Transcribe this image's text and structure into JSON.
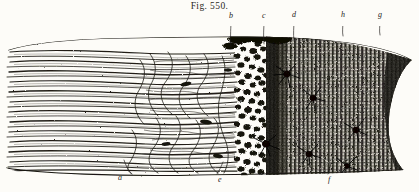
{
  "figure": {
    "caption": "Fig. 550.",
    "type": "engraving",
    "background_color": "#fdfcf8",
    "ink_color": "#1d1b18"
  },
  "labels": [
    {
      "id": "label-b",
      "text": "b",
      "x": 229,
      "y": 12,
      "leader_x": 231,
      "leader_y1": 21,
      "leader_y2": 47
    },
    {
      "id": "label-c",
      "text": "c",
      "x": 262,
      "y": 12,
      "leader_x": 264,
      "leader_y1": 21,
      "leader_y2": 44
    },
    {
      "id": "label-d",
      "text": "d",
      "x": 292,
      "y": 11,
      "leader_x": 294,
      "leader_y1": 21,
      "leader_y2": 40
    },
    {
      "id": "label-h",
      "text": "h",
      "x": 341,
      "y": 11,
      "leader_x": 343,
      "leader_y1": 21,
      "leader_y2": 36
    },
    {
      "id": "label-g-top",
      "text": "g",
      "x": 378,
      "y": 11,
      "leader_x": 380,
      "leader_y1": 21,
      "leader_y2": 35
    },
    {
      "id": "label-a",
      "text": "a",
      "x": 118,
      "y": 174,
      "leader_x": 124,
      "leader_y1": 172,
      "leader_y2": 160
    },
    {
      "id": "label-e",
      "text": "e",
      "x": 218,
      "y": 176,
      "leader_x": 223,
      "leader_y1": 174,
      "leader_y2": 162
    },
    {
      "id": "label-f",
      "text": "f",
      "x": 328,
      "y": 176,
      "leader_x": 331,
      "leader_y1": 174,
      "leader_y2": 163
    }
  ],
  "regions": {
    "fibre_layer": {
      "name": "nerve-fibre-layer",
      "x_start": 10,
      "x_end": 150
    },
    "plexus_layer": {
      "name": "branching-plexus-layer",
      "x_start": 150,
      "x_end": 235
    },
    "granular_layer": {
      "name": "granular-cell-layer",
      "x_start": 235,
      "x_end": 268
    },
    "striated_layer": {
      "name": "dark-striated-layer",
      "x_start": 268,
      "x_end": 412
    }
  },
  "star_cells": [
    {
      "cx": 287,
      "cy": 48
    },
    {
      "cx": 313,
      "cy": 72
    },
    {
      "cx": 266,
      "cy": 118
    },
    {
      "cx": 309,
      "cy": 128
    },
    {
      "cx": 356,
      "cy": 104
    },
    {
      "cx": 347,
      "cy": 140
    }
  ]
}
